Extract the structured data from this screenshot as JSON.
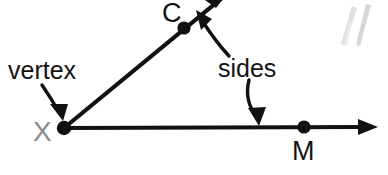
{
  "figure": {
    "type": "geometry-angle-diagram",
    "background_color": "#ffffff",
    "ink_color": "#111111",
    "faint_mark_color": "#b9bcbe",
    "gray_label_color": "#8a8c8e"
  },
  "labels": {
    "vertex": "vertex",
    "sides": "sides",
    "point_c": "C",
    "point_x": "X",
    "point_m": "M"
  },
  "points": [
    {
      "name": "X",
      "label": "X",
      "x": 64,
      "y": 128,
      "role": "vertex"
    },
    {
      "name": "C",
      "label": "C",
      "x": 184,
      "y": 28,
      "role": "point-on-side"
    },
    {
      "name": "M",
      "label": "M",
      "x": 304,
      "y": 127,
      "role": "point-on-side"
    }
  ],
  "rays": [
    {
      "name": "ray-XC",
      "from": "X",
      "through": "C",
      "direction": "up-right",
      "has_arrowhead": true
    },
    {
      "name": "ray-XM",
      "from": "X",
      "through": "M",
      "direction": "right",
      "has_arrowhead": true
    }
  ],
  "annotations": [
    {
      "name": "vertex-callout",
      "text": "vertex",
      "text_x": 8,
      "text_y": 58,
      "points_to": "X",
      "leader": "curve-down-right"
    },
    {
      "name": "sides-callout",
      "text": "sides",
      "text_x": 218,
      "text_y": 54,
      "points_to": [
        "ray-XC",
        "ray-XM"
      ],
      "leader": "two-curves"
    }
  ],
  "artifacts": [
    {
      "name": "scan-smudge",
      "x": 340,
      "y": 4,
      "description": "faint diagonal scan marks"
    }
  ]
}
